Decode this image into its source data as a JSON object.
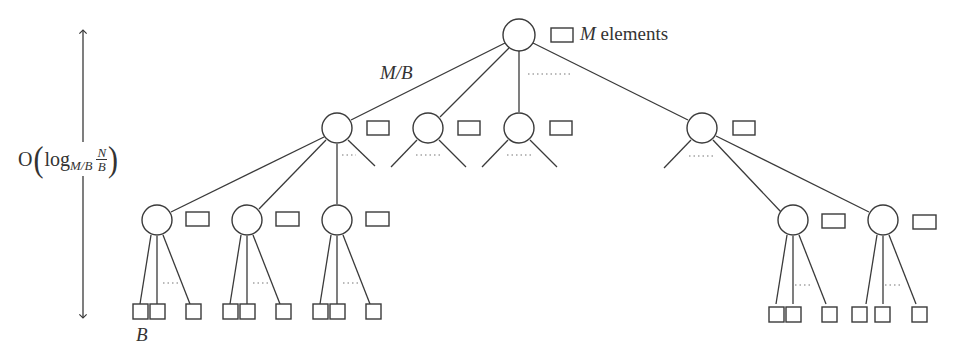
{
  "diagram": {
    "type": "tree",
    "title": "",
    "labels": {
      "root_block_var": "M",
      "root_block_text": " elements",
      "fanout": "M/B",
      "leaf_size": "B",
      "height_prefix": "O",
      "height_log": "log",
      "height_sub": "M/B",
      "height_num": "N",
      "height_den": "B"
    },
    "colors": {
      "stroke": "#3a3a3a",
      "dots": "#777777",
      "background": "#ffffff"
    },
    "nodes": [
      {
        "id": "root",
        "level": 0,
        "cx": 519,
        "cy": 35,
        "buffer": true
      },
      {
        "id": "l1-a",
        "level": 1,
        "cx": 337,
        "cy": 128,
        "buffer": true
      },
      {
        "id": "l1-b",
        "level": 1,
        "cx": 428,
        "cy": 128,
        "buffer": true
      },
      {
        "id": "l1-c",
        "level": 1,
        "cx": 519,
        "cy": 128,
        "buffer": true
      },
      {
        "id": "l1-d",
        "level": 1,
        "cx": 702,
        "cy": 128,
        "buffer": true
      },
      {
        "id": "l2-a",
        "level": 2,
        "cx": 157,
        "cy": 220,
        "buffer": true
      },
      {
        "id": "l2-b",
        "level": 2,
        "cx": 247,
        "cy": 220,
        "buffer": true
      },
      {
        "id": "l2-c",
        "level": 2,
        "cx": 337,
        "cy": 220,
        "buffer": true
      },
      {
        "id": "l2-d",
        "level": 2,
        "cx": 793,
        "cy": 220,
        "buffer": true
      },
      {
        "id": "l2-e",
        "level": 2,
        "cx": 883,
        "cy": 220,
        "buffer": true
      }
    ],
    "leaf_groups": [
      {
        "parent": "l2-a",
        "leaves_x": [
          142,
          165,
          194
        ]
      },
      {
        "parent": "l2-b",
        "leaves_x": [
          232,
          255,
          284
        ]
      },
      {
        "parent": "l2-c",
        "leaves_x": [
          322,
          345,
          374
        ]
      },
      {
        "parent": "l2-d",
        "leaves_x": [
          778,
          801,
          830
        ]
      },
      {
        "parent": "l2-e",
        "leaves_x": [
          868,
          891,
          920
        ]
      }
    ]
  }
}
